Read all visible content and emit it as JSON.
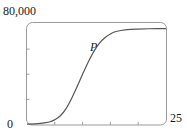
{
  "chart_data": {
    "type": "line",
    "title": "",
    "xlabel": "",
    "ylabel": "",
    "xlim": [
      0,
      25
    ],
    "ylim": [
      0,
      80000
    ],
    "x_tick_labels": [
      "0",
      "25"
    ],
    "y_tick_labels": [
      "0",
      "80,000"
    ],
    "x_minor_ticks": [
      5,
      10,
      15,
      20
    ],
    "y_minor_ticks": [
      20000,
      40000,
      60000
    ],
    "grid": false,
    "legend": null,
    "series": [
      {
        "name": "P",
        "x": [
          0,
          2,
          4,
          5,
          6,
          7,
          8,
          9,
          10,
          11,
          12,
          13,
          14,
          15,
          16,
          18,
          20,
          22,
          25
        ],
        "values": [
          300,
          700,
          2000,
          3800,
          7000,
          12500,
          20500,
          30000,
          40000,
          49500,
          58000,
          64500,
          69000,
          72000,
          74000,
          75500,
          76000,
          76200,
          76300
        ]
      }
    ],
    "annotations": [
      {
        "text": "P",
        "style": "italic",
        "x": 11.5,
        "y": 57000
      }
    ]
  },
  "labels": {
    "y_max": "80,000",
    "origin": "0",
    "x_max": "25",
    "series_name": "P"
  },
  "colors": {
    "curve": "#555555",
    "frame": "#9a9a9a",
    "text": "#1a1a1a"
  }
}
